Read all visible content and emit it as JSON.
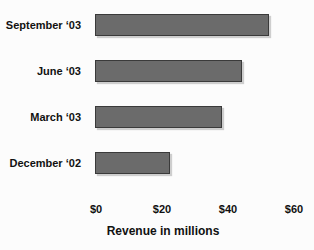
{
  "chart_data": {
    "type": "bar",
    "orientation": "horizontal",
    "xlabel": "Revenue in millions",
    "categories": [
      "September ‘03",
      "June ‘03",
      "March ‘03",
      "December ‘02"
    ],
    "values": [
      52,
      44,
      38,
      22
    ],
    "xlim": [
      0,
      60
    ],
    "x_ticks": [
      {
        "label": "$0",
        "value": 0
      },
      {
        "label": "$20",
        "value": 20
      },
      {
        "label": "$40",
        "value": 40
      },
      {
        "label": "$60",
        "value": 60
      }
    ],
    "grid": false,
    "legend": false,
    "bar_color": "#6b6b6b",
    "bar_border_color": "#3a3a3a",
    "background_color": "#fcfcfc",
    "text_color": "#111111"
  }
}
